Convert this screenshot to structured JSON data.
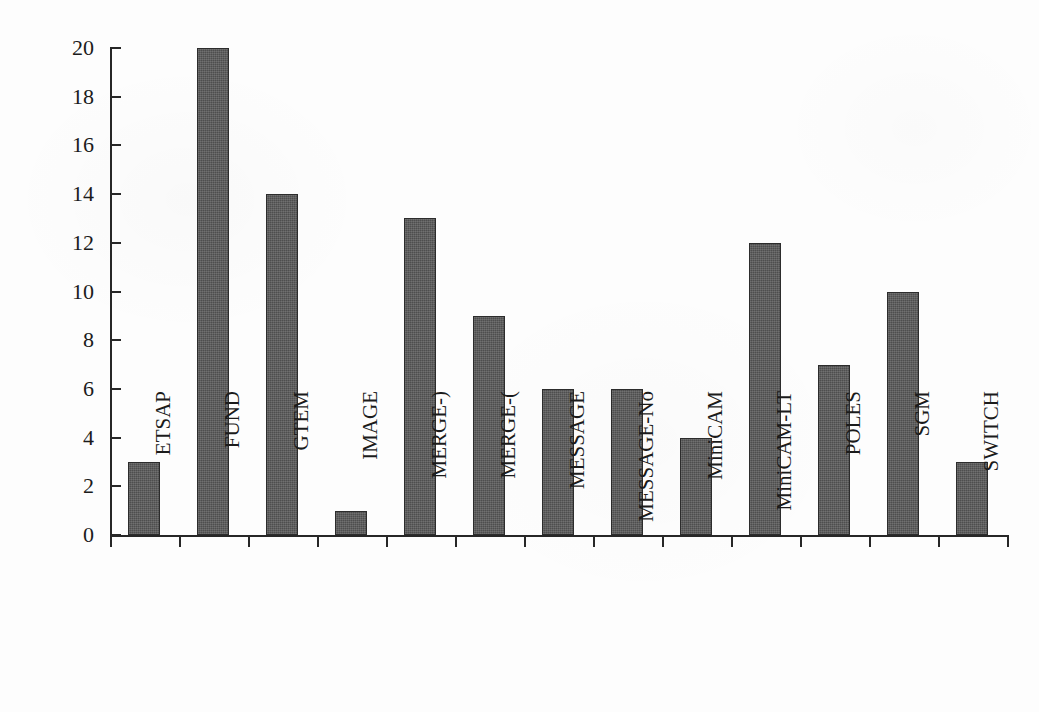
{
  "chart_data": {
    "type": "bar",
    "title": "",
    "xlabel": "",
    "ylabel": "Carbon tax ($/tC) in 2015",
    "ylim": [
      0,
      20
    ],
    "ytick_step": 2,
    "ytick_labels": [
      "0",
      "2",
      "4",
      "6",
      "8",
      "10",
      "12",
      "14",
      "16",
      "18",
      "20"
    ],
    "grid": false,
    "legend": null,
    "bar_color": "#4e4e4e",
    "bar_edge_color": "#2c2c2c",
    "axis_color": "#272727",
    "background_color": "#fdfdfd",
    "categories": [
      "ETSAP",
      "FUND",
      "GTEM",
      "IMAGE",
      "MERGE-)",
      "MERGE-(",
      "MESSAGE",
      "MESSAGE-No",
      "MiniCAM",
      "MiniCAM-LT",
      "POLES",
      "SGM",
      "SWITCH"
    ],
    "values": [
      3,
      20,
      14,
      1,
      13,
      9,
      6,
      6,
      4,
      12,
      7,
      10,
      3
    ]
  }
}
